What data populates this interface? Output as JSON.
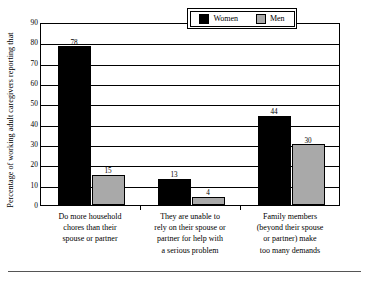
{
  "chart_data": {
    "type": "bar",
    "title": "",
    "subtitle": "",
    "xlabel": "",
    "ylabel": "Percentage of working adult caregivers reporting that",
    "ylim": [
      0,
      90
    ],
    "ytick_step": 10,
    "yticks": [
      "90",
      "80",
      "70",
      "60",
      "50",
      "40",
      "30",
      "20",
      "10",
      "0"
    ],
    "grid": true,
    "grid_orientation": "horizontal",
    "legend_position": "top-right-inside",
    "categories": [
      "Do more household chores than their spouse or partner",
      "They are unable to rely on their spouse or partner for help with a serious problem",
      "Family members (beyond their spouse or partner) make too many demands"
    ],
    "category_lines": [
      [
        "Do more household",
        "chores than their",
        "spouse or partner"
      ],
      [
        "They are unable to",
        "rely on their spouse or",
        "partner for help with",
        "a serious problem"
      ],
      [
        "Family members",
        "(beyond their spouse",
        "or partner) make",
        "too many demands"
      ]
    ],
    "series": [
      {
        "name": "Women",
        "color": "#000000",
        "values": [
          78,
          13,
          44
        ]
      },
      {
        "name": "Men",
        "color": "#a9a9a9",
        "values": [
          15,
          4,
          30
        ]
      }
    ],
    "data_labels": [
      [
        "78",
        "13",
        "44"
      ],
      [
        "15",
        "4",
        "30"
      ]
    ]
  },
  "legend": {
    "items": [
      {
        "label": "Women",
        "swatch": "women"
      },
      {
        "label": "Men",
        "swatch": "men"
      }
    ]
  }
}
